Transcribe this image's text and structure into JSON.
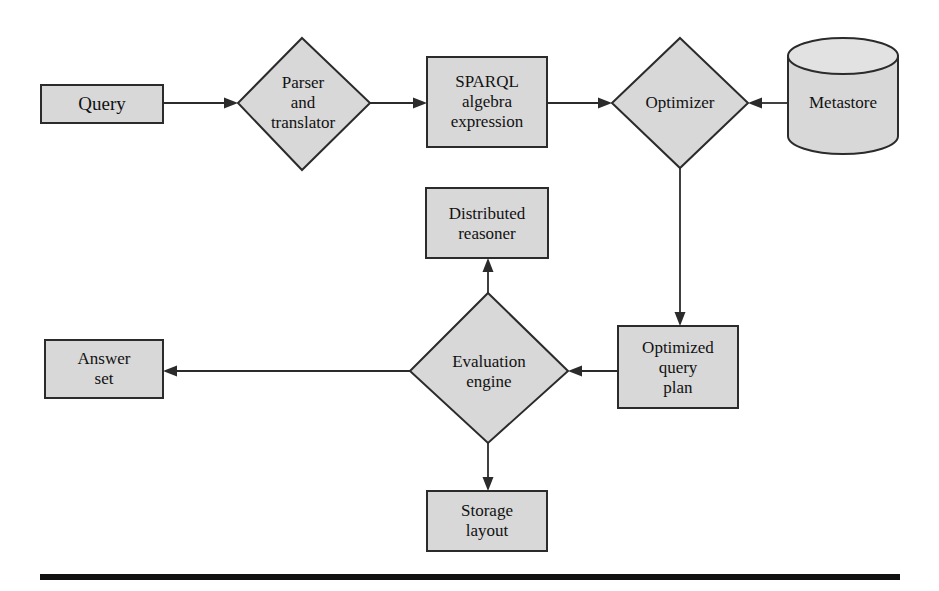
{
  "figure": {
    "background_color": "#ffffff",
    "shape_fill_color": "#d8d8d8",
    "shape_stroke_color": "#2b2b2b",
    "rule_color": "#111111"
  },
  "nodes": {
    "query": {
      "label": "Query",
      "shape": "rectangle"
    },
    "parser_translator": {
      "label": "Parser\nand\ntranslator",
      "shape": "diamond"
    },
    "sparql_algebra": {
      "label": "SPARQL\nalgebra\nexpression",
      "shape": "rectangle"
    },
    "optimizer": {
      "label": "Optimizer",
      "shape": "diamond"
    },
    "metastore": {
      "label": "Metastore",
      "shape": "cylinder"
    },
    "distributed_reasoner": {
      "label": "Distributed\nreasoner",
      "shape": "rectangle"
    },
    "evaluation_engine": {
      "label": "Evaluation\nengine",
      "shape": "diamond"
    },
    "optimized_query_plan": {
      "label": "Optimized\nquery\nplan",
      "shape": "rectangle"
    },
    "answer_set": {
      "label": "Answer\nset",
      "shape": "rectangle"
    },
    "storage_layout": {
      "label": "Storage\nlayout",
      "shape": "rectangle"
    }
  },
  "edges": [
    {
      "from": "query",
      "to": "parser_translator",
      "direction": "right"
    },
    {
      "from": "parser_translator",
      "to": "sparql_algebra",
      "direction": "right"
    },
    {
      "from": "sparql_algebra",
      "to": "optimizer",
      "direction": "right"
    },
    {
      "from": "metastore",
      "to": "optimizer",
      "direction": "left"
    },
    {
      "from": "optimizer",
      "to": "optimized_query_plan",
      "direction": "down"
    },
    {
      "from": "optimized_query_plan",
      "to": "evaluation_engine",
      "direction": "left"
    },
    {
      "from": "evaluation_engine",
      "to": "distributed_reasoner",
      "direction": "up"
    },
    {
      "from": "evaluation_engine",
      "to": "storage_layout",
      "direction": "down"
    },
    {
      "from": "evaluation_engine",
      "to": "answer_set",
      "direction": "left"
    }
  ]
}
